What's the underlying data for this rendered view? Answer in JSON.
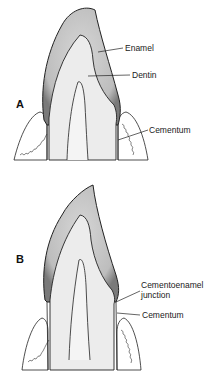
{
  "figure": {
    "panels": [
      {
        "letter": "A",
        "labels": {
          "enamel": "Enamel",
          "dentin": "Dentin",
          "cementum": "Cementum"
        }
      },
      {
        "letter": "B",
        "labels": {
          "cej_line1": "Cementoenamel",
          "cej_line2": "junction",
          "cementum": "Cementum"
        }
      }
    ]
  },
  "colors": {
    "enamel_fill": "#c9c9c9",
    "dentin_fill": "#ececec",
    "outline": "#222222",
    "gum_fill": "#ffffff"
  }
}
